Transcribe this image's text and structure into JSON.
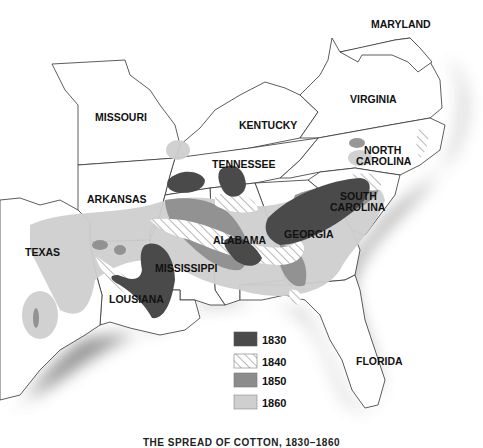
{
  "map": {
    "caption": "THE SPREAD OF COTTON, 1830–1860",
    "states": [
      {
        "id": "maryland",
        "label": "MARYLAND"
      },
      {
        "id": "missouri",
        "label": "MISSOURI"
      },
      {
        "id": "virginia",
        "label": "VIRGINIA"
      },
      {
        "id": "kentucky",
        "label": "KENTUCKY"
      },
      {
        "id": "north-carolina",
        "label_line1": "NORTH",
        "label_line2": "CAROLINA"
      },
      {
        "id": "tennessee",
        "label": "TENNESSEE"
      },
      {
        "id": "arkansas",
        "label": "ARKANSAS"
      },
      {
        "id": "south-carolina",
        "label_line1": "SOUTH",
        "label_line2": "CAROLINA"
      },
      {
        "id": "georgia",
        "label": "GEORGIA"
      },
      {
        "id": "alabama",
        "label": "ALABAMA"
      },
      {
        "id": "texas",
        "label": "TEXAS"
      },
      {
        "id": "mississippi",
        "label": "MISSISSIPPI"
      },
      {
        "id": "louisiana",
        "label": "LOUSIANA"
      },
      {
        "id": "florida",
        "label": "FLORIDA"
      }
    ],
    "legend": [
      {
        "year": "1830",
        "fill": "#4a4a4a",
        "pattern": "solid"
      },
      {
        "year": "1840",
        "fill": "#ffffff",
        "pattern": "hatch"
      },
      {
        "year": "1850",
        "fill": "#8c8c8c",
        "pattern": "solid"
      },
      {
        "year": "1860",
        "fill": "#cfcfcf",
        "pattern": "solid"
      }
    ],
    "colors": {
      "water_shadow": "#8a8a8a",
      "land": "#ffffff",
      "border": "#333333"
    }
  }
}
